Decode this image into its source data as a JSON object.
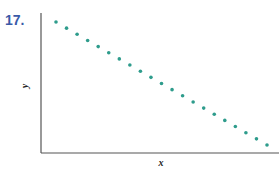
{
  "problem": {
    "number": "17."
  },
  "chart_data": {
    "type": "scatter",
    "title": "",
    "xlabel": "x",
    "ylabel": "y",
    "grid": false,
    "legend": null,
    "ticks": false,
    "point_color": "#2e9c8c",
    "x": [
      1,
      2,
      3,
      4,
      5,
      6,
      7,
      8,
      9,
      10,
      11,
      12,
      13,
      14,
      15,
      16,
      17,
      18,
      19,
      20,
      21
    ],
    "y": [
      21,
      20,
      19,
      18,
      17,
      16,
      15,
      14,
      13,
      12,
      11,
      10,
      9,
      8,
      7,
      6,
      5,
      4,
      3,
      2,
      1
    ]
  }
}
